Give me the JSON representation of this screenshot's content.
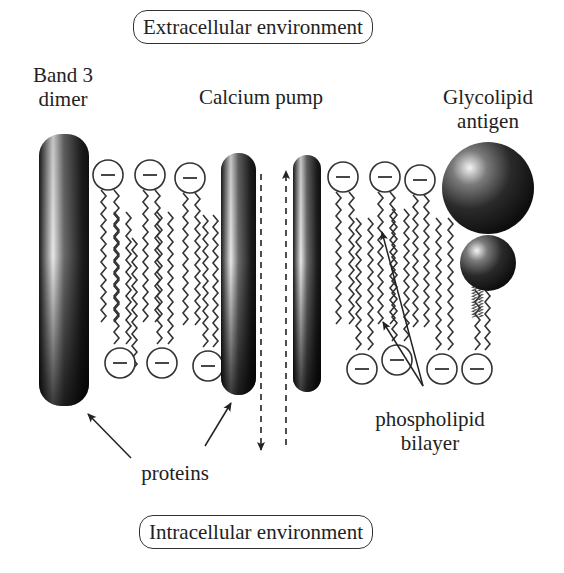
{
  "environments": {
    "top": "Extracellular environment",
    "bottom": "Intracellular environment"
  },
  "labels": {
    "band3_line1": "Band 3",
    "band3_line2": "dimer",
    "calcium_pump": "Calcium pump",
    "glycolipid_line1": "Glycolipid",
    "glycolipid_line2": "antigen",
    "proteins": "proteins",
    "phospholipid_line1": "phospholipid",
    "phospholipid_line2": "bilayer"
  },
  "head_symbol": "−",
  "components": {
    "band3_dimer": {
      "x": 39,
      "y": 134,
      "w": 50,
      "h": 272
    },
    "pump_left": {
      "x": 221,
      "y": 153,
      "w": 35,
      "h": 242
    },
    "pump_right": {
      "x": 293,
      "y": 155,
      "w": 28,
      "h": 237
    },
    "glycolipid_big_sphere": {
      "cx": 488,
      "cy": 188,
      "r": 46
    },
    "glycolipid_small_sphere": {
      "cx": 488,
      "cy": 263,
      "r": 28
    }
  },
  "phospholipid_heads": {
    "top": [
      [
        108,
        175
      ],
      [
        150,
        175
      ],
      [
        190,
        178
      ],
      [
        343,
        177
      ],
      [
        385,
        177
      ],
      [
        420,
        180
      ]
    ],
    "bottom": [
      [
        120,
        363
      ],
      [
        162,
        363
      ],
      [
        208,
        366
      ],
      [
        362,
        369
      ],
      [
        397,
        360
      ],
      [
        442,
        369
      ],
      [
        477,
        369
      ]
    ]
  },
  "colors": {
    "ink": "#222222",
    "protein_dark": "#151515",
    "protein_highlight": "#f2f2f2",
    "background": "#ffffff"
  }
}
